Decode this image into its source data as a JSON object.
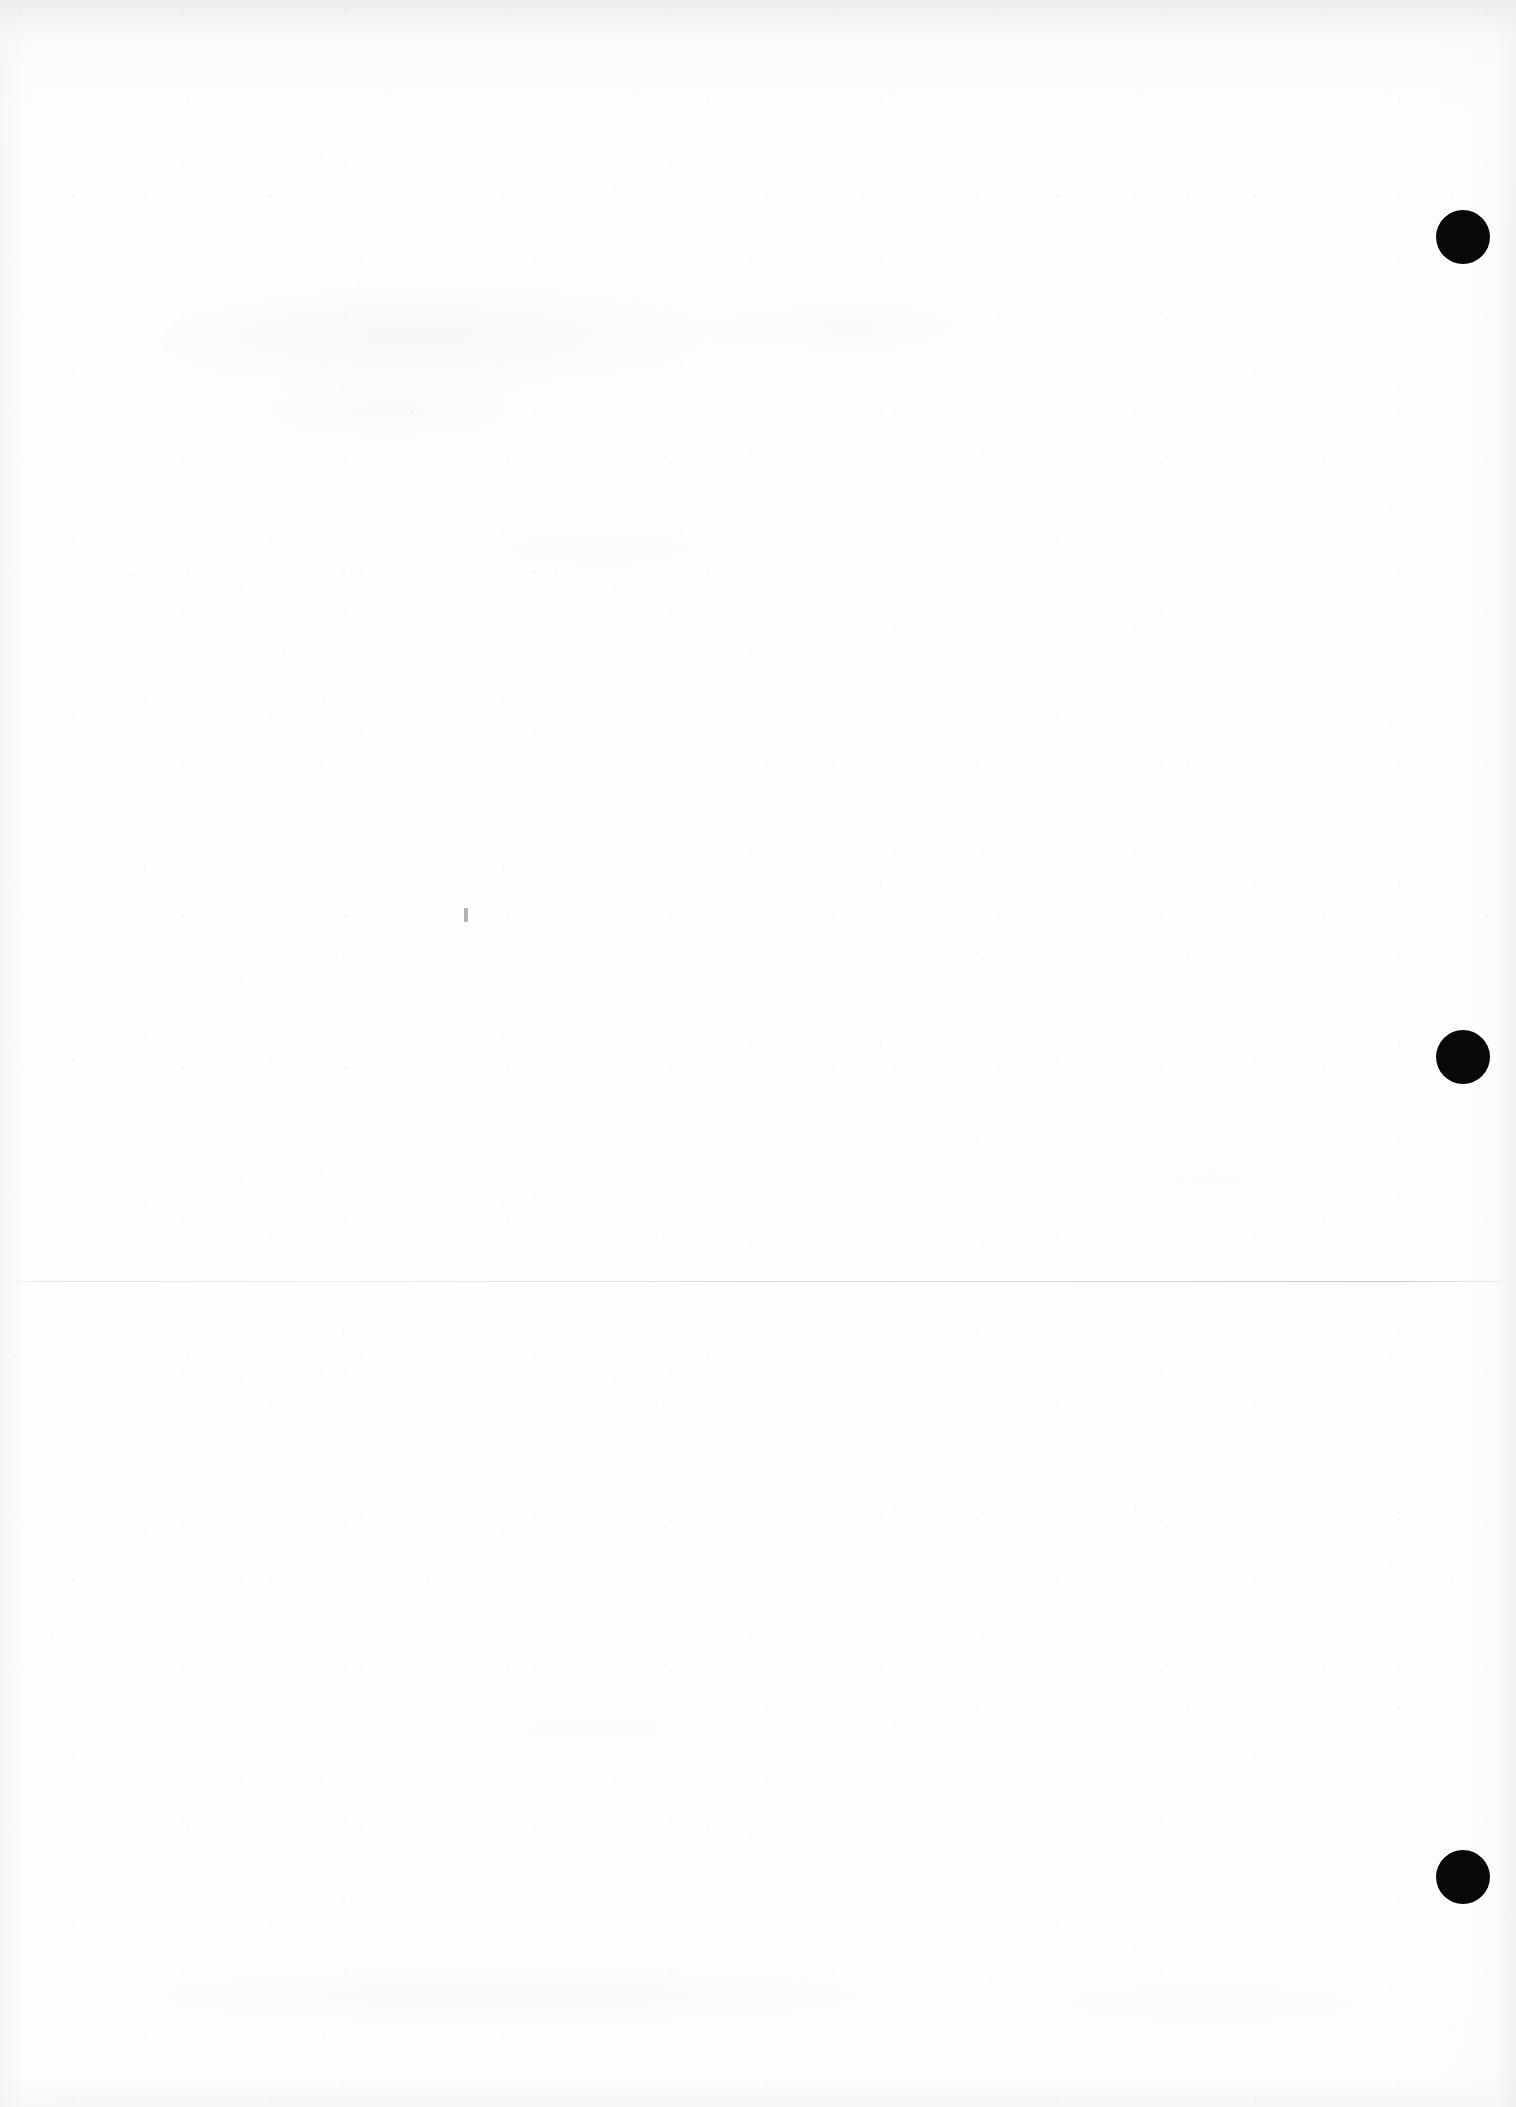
{
  "document": {
    "kind": "scanned-page",
    "page_label": "",
    "visible_text": "",
    "background_color": "#ffffff",
    "paper_tone": "#fefefe",
    "edge_shadow_color": "#eceef1",
    "width_px": 1516,
    "height_px": 2107
  },
  "marks": {
    "registration_dots": {
      "color": "#080808",
      "diameter_px": 54,
      "items": [
        {
          "name": "registration-dot-top",
          "cx": 1463,
          "cy": 237,
          "r": 27
        },
        {
          "name": "registration-dot-middle",
          "cx": 1463,
          "cy": 1057,
          "r": 27
        },
        {
          "name": "registration-dot-bottom",
          "cx": 1463,
          "cy": 1877,
          "r": 27
        }
      ]
    },
    "fold_line": {
      "name": "horizontal-fold-line",
      "color": "#d6d8de",
      "y": 1281,
      "x_start": 0,
      "x_end": 1502,
      "thickness_px": 1
    },
    "ink_fleck": {
      "name": "ink-fleck",
      "x": 464,
      "y": 908,
      "width": 4,
      "height": 14,
      "color": "#b0b2ba"
    },
    "ghost_smudges": [
      {
        "name": "ghost-smudge-upper-band",
        "x": 160,
        "y": 282,
        "w": 640,
        "h": 120,
        "opacity": 0.3
      },
      {
        "name": "ghost-smudge-upper-right",
        "x": 700,
        "y": 292,
        "w": 300,
        "h": 70,
        "opacity": 0.22
      },
      {
        "name": "ghost-smudge-mid-left",
        "x": 240,
        "y": 370,
        "w": 330,
        "h": 80,
        "opacity": 0.22
      },
      {
        "name": "ghost-smudge-mid-band",
        "x": 430,
        "y": 520,
        "w": 340,
        "h": 60,
        "opacity": 0.16
      },
      {
        "name": "ghost-smudge-lower-band",
        "x": 60,
        "y": 1960,
        "w": 900,
        "h": 70,
        "opacity": 0.26
      },
      {
        "name": "ghost-smudge-lower-right",
        "x": 1000,
        "y": 1975,
        "w": 420,
        "h": 55,
        "opacity": 0.18
      },
      {
        "name": "ghost-smudge-center-low",
        "x": 380,
        "y": 1700,
        "w": 420,
        "h": 60,
        "opacity": 0.12
      },
      {
        "name": "ghost-smudge-right-mid",
        "x": 1050,
        "y": 1150,
        "w": 330,
        "h": 60,
        "opacity": 0.1
      }
    ]
  }
}
